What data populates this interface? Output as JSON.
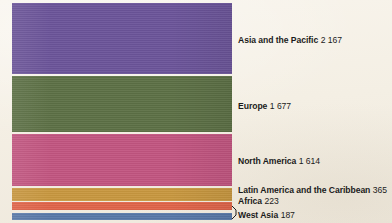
{
  "chart_data": {
    "type": "bar",
    "orientation": "stacked-horizontal-bands",
    "title": "",
    "subtitle": "",
    "xlabel": "",
    "ylabel": "",
    "grid": false,
    "legend_position": "right-inline-labels",
    "categories": [
      "Asia and the Pacific",
      "Europe",
      "North America",
      "Latin America and the Caribbean",
      "Africa",
      "West Asia"
    ],
    "values": [
      2167,
      1677,
      1614,
      365,
      223,
      187
    ],
    "value_labels": [
      "2 167",
      "1 677",
      "1 614",
      "365",
      "223",
      "187"
    ],
    "colors": [
      "#6b5499",
      "#5c7045",
      "#c25580",
      "#c8973f",
      "#e06449",
      "#5878a8"
    ],
    "total": 6233,
    "series": [
      {
        "name": "Asia and the Pacific",
        "value": 2167,
        "value_label": "2 167",
        "color": "#6b5499"
      },
      {
        "name": "Europe",
        "value": 1677,
        "value_label": "1 677",
        "color": "#5c7045"
      },
      {
        "name": "North America",
        "value": 1614,
        "value_label": "1 614",
        "color": "#c25580"
      },
      {
        "name": "Latin America and the Caribbean",
        "value": 365,
        "value_label": "365",
        "color": "#c8973f"
      },
      {
        "name": "Africa",
        "value": 223,
        "value_label": "223",
        "color": "#e06449"
      },
      {
        "name": "West Asia",
        "value": 187,
        "value_label": "187",
        "color": "#5878a8"
      }
    ]
  },
  "bands": [
    {
      "name": "Asia and the Pacific",
      "value_label": "2 167",
      "color": "#6b5499",
      "top": 0,
      "height": 71
    },
    {
      "name": "Europe",
      "value_label": "1 677",
      "color": "#5c7045",
      "top": 73,
      "height": 56
    },
    {
      "name": "North America",
      "value_label": "1 614",
      "color": "#c25580",
      "top": 131,
      "height": 52
    },
    {
      "name": "Latin America and the Caribbean",
      "value_label": "365",
      "color": "#c8973f",
      "top": 185,
      "height": 13
    },
    {
      "name": "Africa",
      "value_label": "223",
      "color": "#e06449",
      "top": 199,
      "height": 8
    },
    {
      "name": "West Asia",
      "value_label": "187",
      "color": "#5878a8",
      "top": 210,
      "height": 7
    }
  ],
  "labels": [
    {
      "name": "Asia and the Pacific",
      "value_label": "2 167",
      "top": 35
    },
    {
      "name": "Europe",
      "value_label": "1 677",
      "top": 101
    },
    {
      "name": "North America",
      "value_label": "1 614",
      "top": 156
    },
    {
      "name": "Latin America and the Caribbean",
      "value_label": "365",
      "top": 185
    },
    {
      "name": "Africa",
      "value_label": "223",
      "top": 196
    },
    {
      "name": "West Asia",
      "value_label": "187",
      "top": 210
    }
  ],
  "background_color": "#f6f2e9"
}
